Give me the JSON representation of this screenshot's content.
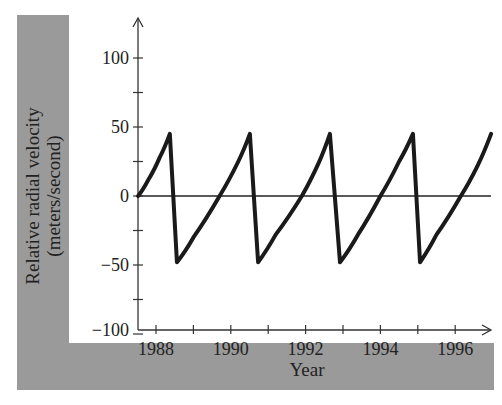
{
  "chart_data": {
    "type": "line",
    "title": "",
    "xlabel": "Year",
    "ylabel_line1": "Relative radial velocity",
    "ylabel_line2": "(meters/second)",
    "xlim": [
      1987.5,
      1997.2
    ],
    "ylim": [
      -100,
      125
    ],
    "x_ticks": [
      1988,
      1989,
      1990,
      1991,
      1992,
      1993,
      1994,
      1995,
      1996
    ],
    "x_tick_labels": [
      "1988",
      "1990",
      "1992",
      "1994",
      "1996"
    ],
    "y_ticks": [
      -100,
      -75,
      -50,
      -25,
      0,
      25,
      50,
      75,
      100
    ],
    "y_tick_labels": [
      "−100",
      "−50",
      "0",
      "50",
      "100"
    ],
    "grid": false,
    "legend": null,
    "reference_line": {
      "y": 0
    },
    "series": [
      {
        "name": "radial velocity",
        "color": "#1a1a1a",
        "x": [
          1987.52,
          1987.8,
          1988.1,
          1988.37,
          1988.56,
          1989.0,
          1989.7,
          1990.2,
          1990.51,
          1990.73,
          1991.2,
          1991.9,
          1992.35,
          1992.65,
          1992.92,
          1993.4,
          1994.0,
          1994.5,
          1994.87,
          1995.06,
          1995.5,
          1996.15,
          1996.6,
          1996.96
        ],
        "values": [
          0,
          12,
          28,
          45,
          -48,
          -30,
          0,
          25,
          45,
          -48,
          -28,
          0,
          24,
          45,
          -48,
          -28,
          0,
          25,
          45,
          -48,
          -28,
          0,
          22,
          45
        ]
      }
    ]
  }
}
